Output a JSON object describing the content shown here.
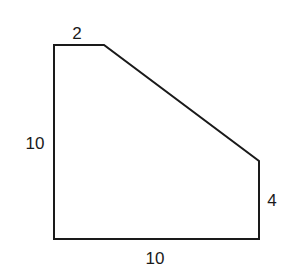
{
  "diagram": {
    "type": "polygon",
    "stroke_color": "#1a1a1a",
    "background": "#ffffff",
    "points": [
      [
        54,
        45
      ],
      [
        104,
        45
      ],
      [
        259,
        161
      ],
      [
        259,
        239
      ],
      [
        54,
        239
      ]
    ],
    "labels": {
      "top": "2",
      "left": "10",
      "right": "4",
      "bottom": "10"
    }
  }
}
